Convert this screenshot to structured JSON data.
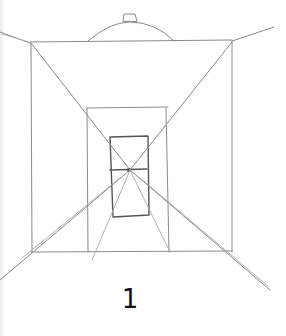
{
  "figure": {
    "caption_number": "1",
    "stroke_color": "#8a8a8a",
    "dark_stroke_color": "#555555",
    "background": "#ffffff",
    "vanishing_point": [
      130,
      170
    ]
  }
}
